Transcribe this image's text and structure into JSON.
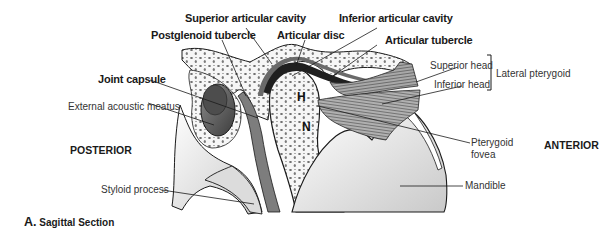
{
  "figure": {
    "caption_letter": "A.",
    "caption_text": "Sagittal Section",
    "orientation": {
      "left": "POSTERIOR",
      "right": "ANTERIOR"
    },
    "bone_markers": {
      "head": "H",
      "neck": "N"
    },
    "labels": {
      "superior_articular_cavity": "Superior articular cavity",
      "inferior_articular_cavity": "Inferior articular cavity",
      "postglenoid_tubercle": "Postglenoid tubercle",
      "articular_disc": "Articular disc",
      "articular_tubercle": "Articular tubercle",
      "joint_capsule": "Joint capsule",
      "external_acoustic_meatus": "External acoustic meatus",
      "superior_head": "Superior head",
      "inferior_head": "Inferior head",
      "lateral_pterygoid": "Lateral pterygoid",
      "pterygoid_fovea_line1": "Pterygoid",
      "pterygoid_fovea_line2": "fovea",
      "mandible": "Mandible",
      "styloid_process": "Styloid process"
    },
    "colors": {
      "outline": "#1a1a1a",
      "bone_fill": "#f4f4f4",
      "shadow": "#9a9a9a",
      "muscle": "#7a7a7a",
      "disc": "#2a2a2a"
    }
  }
}
